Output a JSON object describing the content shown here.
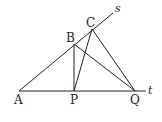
{
  "diagram": {
    "type": "geometry",
    "points": {
      "A": {
        "label": "A",
        "x": 19,
        "y": 91
      },
      "P": {
        "label": "P",
        "x": 74,
        "y": 91
      },
      "Q": {
        "label": "Q",
        "x": 135,
        "y": 91
      },
      "B": {
        "label": "B",
        "x": 74,
        "y": 44
      },
      "C": {
        "label": "C",
        "x": 92,
        "y": 29
      }
    },
    "lines": {
      "s": {
        "label": "s"
      },
      "t": {
        "label": "t"
      }
    },
    "segments": [
      "A-s",
      "A-t",
      "B-P",
      "B-Q",
      "C-P",
      "C-Q"
    ]
  }
}
